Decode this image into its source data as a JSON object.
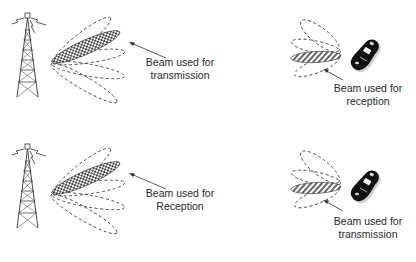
{
  "diagram": {
    "panels": [
      {
        "id": "top-left",
        "device": "base-station-tower",
        "highlighted_beam_pattern": "checkered",
        "label_line1": "Beam used for",
        "label_line2": "transmission"
      },
      {
        "id": "top-right",
        "device": "mobile-phone",
        "highlighted_beam_pattern": "diagonal-hatch",
        "label_line1": "Beam used for",
        "label_line2": "reception"
      },
      {
        "id": "bottom-left",
        "device": "base-station-tower",
        "highlighted_beam_pattern": "checkered",
        "label_line1": "Beam used for",
        "label_line2": "Reception"
      },
      {
        "id": "bottom-right",
        "device": "mobile-phone",
        "highlighted_beam_pattern": "diagonal-hatch",
        "label_line1": "Beam used for",
        "label_line2": "transmission"
      }
    ],
    "colors": {
      "line": "#333333",
      "checker_dark": "#444444",
      "hatch": "#555555",
      "phone_body": "#111111"
    }
  }
}
